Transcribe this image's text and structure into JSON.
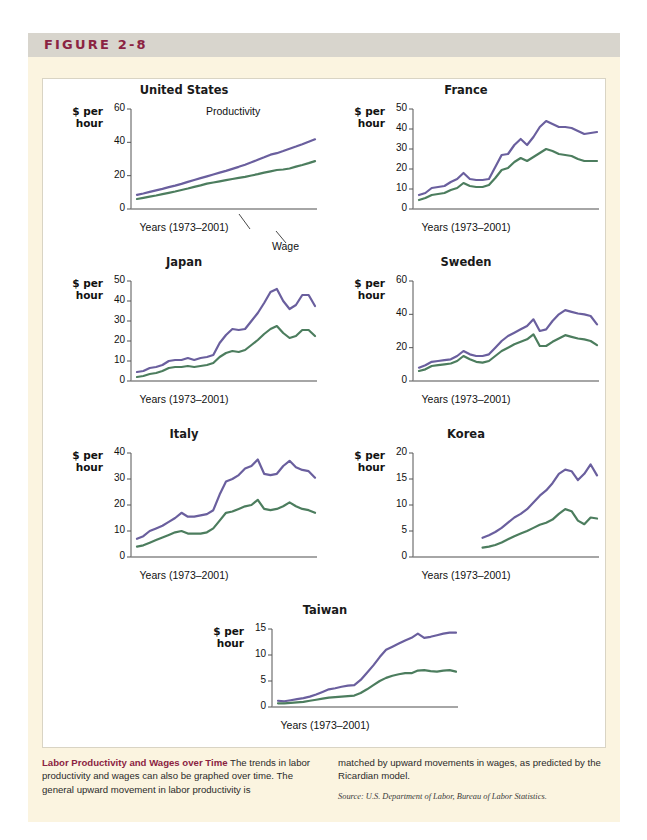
{
  "figure": {
    "label": "FIGURE 2-8",
    "accent_color": "#8b2342",
    "band_color": "#d8d5cd",
    "box_color": "#fbf4e0"
  },
  "series_colors": {
    "productivity": "#6a5f9e",
    "wage": "#4c7d5e"
  },
  "axis_titles": {
    "y_line1": "$ per",
    "y_line2": "hour",
    "x": "Years (1973–2001)"
  },
  "annotations": {
    "productivity": "Productivity",
    "wage": "Wage"
  },
  "caption": {
    "title": "Labor Productivity and Wages over Time",
    "left_text": " The trends in labor productivity and wages can also be graphed over time. The general upward movement in labor productivity is",
    "right_text": "matched by upward movements in wages, as predicted by the Ricardian model.",
    "source": "Source: U.S. Department of Labor, Bureau of Labor Statistics."
  },
  "chart_data": [
    {
      "type": "line",
      "title": "United States",
      "xlabel": "Years (1973–2001)",
      "ylabel": "$ per hour",
      "ylim": [
        0,
        60
      ],
      "yticks": [
        0,
        20,
        40,
        60
      ],
      "grid": false,
      "legend": "inline-annotations",
      "x": [
        1973,
        1974,
        1975,
        1976,
        1977,
        1978,
        1979,
        1980,
        1981,
        1982,
        1983,
        1984,
        1985,
        1986,
        1987,
        1988,
        1989,
        1990,
        1991,
        1992,
        1993,
        1994,
        1995,
        1996,
        1997,
        1998,
        1999,
        2000,
        2001
      ],
      "series": [
        {
          "name": "Productivity",
          "values": [
            8.5,
            9.3,
            10.3,
            11.2,
            12.1,
            13.1,
            14.0,
            15.1,
            16.3,
            17.4,
            18.5,
            19.6,
            20.7,
            21.8,
            22.9,
            24.1,
            25.3,
            26.6,
            28.0,
            29.5,
            31.0,
            32.6,
            33.5,
            34.8,
            36.2,
            37.5,
            38.9,
            40.4,
            41.8
          ]
        },
        {
          "name": "Wage",
          "values": [
            6.0,
            6.7,
            7.4,
            8.1,
            8.9,
            9.7,
            10.5,
            11.4,
            12.3,
            13.3,
            14.2,
            15.2,
            15.9,
            16.6,
            17.3,
            18.0,
            18.7,
            19.3,
            20.1,
            20.9,
            21.8,
            22.6,
            23.4,
            23.7,
            24.3,
            25.4,
            26.4,
            27.5,
            28.7
          ]
        }
      ]
    },
    {
      "type": "line",
      "title": "France",
      "xlabel": "Years (1973–2001)",
      "ylabel": "$ per hour",
      "ylim": [
        0,
        50
      ],
      "yticks": [
        0,
        10,
        20,
        30,
        40,
        50
      ],
      "grid": false,
      "x": [
        1973,
        1974,
        1975,
        1976,
        1977,
        1978,
        1979,
        1980,
        1981,
        1982,
        1983,
        1984,
        1985,
        1986,
        1987,
        1988,
        1989,
        1990,
        1991,
        1992,
        1993,
        1994,
        1995,
        1996,
        1997,
        1998,
        1999,
        2000,
        2001
      ],
      "series": [
        {
          "name": "Productivity",
          "values": [
            7.0,
            8.0,
            10.5,
            11.0,
            11.5,
            13.5,
            15.0,
            18.0,
            15.0,
            14.5,
            14.5,
            15.0,
            21.0,
            27.0,
            27.5,
            32.0,
            35.0,
            32.0,
            36.0,
            41.0,
            44.0,
            42.5,
            41.0,
            41.0,
            40.5,
            39.0,
            37.5,
            38.0,
            38.5
          ]
        },
        {
          "name": "Wage",
          "values": [
            4.5,
            5.5,
            7.0,
            7.5,
            8.0,
            9.5,
            10.5,
            13.0,
            11.5,
            11.0,
            11.0,
            12.0,
            15.5,
            19.5,
            20.5,
            23.5,
            25.5,
            24.0,
            26.0,
            28.0,
            30.0,
            29.0,
            27.5,
            27.0,
            26.5,
            25.0,
            24.0,
            24.0,
            24.0
          ]
        }
      ]
    },
    {
      "type": "line",
      "title": "Japan",
      "xlabel": "Years (1973–2001)",
      "ylabel": "$ per hour",
      "ylim": [
        0,
        50
      ],
      "yticks": [
        0,
        10,
        20,
        30,
        40,
        50
      ],
      "grid": false,
      "x": [
        1973,
        1974,
        1975,
        1976,
        1977,
        1978,
        1979,
        1980,
        1981,
        1982,
        1983,
        1984,
        1985,
        1986,
        1987,
        1988,
        1989,
        1990,
        1991,
        1992,
        1993,
        1994,
        1995,
        1996,
        1997,
        1998,
        1999,
        2000,
        2001
      ],
      "series": [
        {
          "name": "Productivity",
          "values": [
            4.5,
            5.0,
            6.5,
            7.0,
            8.0,
            10.0,
            10.5,
            10.5,
            11.5,
            10.5,
            11.5,
            12.0,
            13.0,
            19.0,
            23.0,
            26.0,
            25.5,
            26.0,
            30.0,
            34.0,
            39.0,
            44.5,
            46.0,
            40.0,
            36.0,
            38.0,
            43.0,
            43.0,
            37.5
          ]
        },
        {
          "name": "Wage",
          "values": [
            2.0,
            2.5,
            3.5,
            4.0,
            5.0,
            6.5,
            7.0,
            7.0,
            7.5,
            7.0,
            7.5,
            8.0,
            9.0,
            12.0,
            14.0,
            15.0,
            14.5,
            15.5,
            18.0,
            20.5,
            23.5,
            26.0,
            27.5,
            24.0,
            21.5,
            22.5,
            25.5,
            25.5,
            22.5
          ]
        }
      ]
    },
    {
      "type": "line",
      "title": "Sweden",
      "xlabel": "Years (1973–2001)",
      "ylabel": "$ per hour",
      "ylim": [
        0,
        60
      ],
      "yticks": [
        0,
        20,
        40,
        60
      ],
      "grid": false,
      "x": [
        1973,
        1974,
        1975,
        1976,
        1977,
        1978,
        1979,
        1980,
        1981,
        1982,
        1983,
        1984,
        1985,
        1986,
        1987,
        1988,
        1989,
        1990,
        1991,
        1992,
        1993,
        1994,
        1995,
        1996,
        1997,
        1998,
        1999,
        2000,
        2001
      ],
      "series": [
        {
          "name": "Productivity",
          "values": [
            8.0,
            9.5,
            11.5,
            12.0,
            12.5,
            13.0,
            15.0,
            18.0,
            16.0,
            15.0,
            15.0,
            16.0,
            20.0,
            24.0,
            27.0,
            29.0,
            31.0,
            33.0,
            37.0,
            30.0,
            31.0,
            36.0,
            40.0,
            42.5,
            41.5,
            40.5,
            40.0,
            39.0,
            34.0
          ]
        },
        {
          "name": "Wage",
          "values": [
            6.0,
            7.0,
            9.0,
            9.5,
            10.0,
            10.5,
            12.0,
            15.0,
            13.0,
            11.5,
            11.0,
            12.0,
            15.0,
            18.0,
            20.0,
            22.0,
            23.5,
            25.0,
            28.0,
            21.0,
            21.0,
            23.5,
            25.5,
            27.5,
            26.5,
            25.5,
            25.0,
            24.0,
            21.5
          ]
        }
      ]
    },
    {
      "type": "line",
      "title": "Italy",
      "xlabel": "Years (1973–2001)",
      "ylabel": "$ per hour",
      "ylim": [
        0,
        40
      ],
      "yticks": [
        0,
        10,
        20,
        30,
        40
      ],
      "grid": false,
      "x": [
        1973,
        1974,
        1975,
        1976,
        1977,
        1978,
        1979,
        1980,
        1981,
        1982,
        1983,
        1984,
        1985,
        1986,
        1987,
        1988,
        1989,
        1990,
        1991,
        1992,
        1993,
        1994,
        1995,
        1996,
        1997,
        1998,
        1999,
        2000,
        2001
      ],
      "series": [
        {
          "name": "Productivity",
          "values": [
            7.0,
            8.0,
            10.0,
            11.0,
            12.0,
            13.5,
            15.0,
            17.0,
            15.5,
            15.5,
            16.0,
            16.5,
            18.0,
            24.0,
            29.0,
            30.0,
            31.5,
            34.0,
            35.0,
            37.5,
            32.0,
            31.5,
            32.0,
            35.0,
            37.0,
            34.5,
            33.5,
            33.0,
            30.5
          ]
        },
        {
          "name": "Wage",
          "values": [
            4.0,
            4.5,
            5.5,
            6.5,
            7.5,
            8.5,
            9.5,
            10.0,
            9.0,
            9.0,
            9.0,
            9.5,
            11.0,
            14.0,
            17.0,
            17.5,
            18.5,
            19.5,
            20.0,
            22.0,
            18.5,
            18.0,
            18.5,
            19.5,
            21.0,
            19.5,
            18.5,
            18.0,
            17.0
          ]
        }
      ]
    },
    {
      "type": "line",
      "title": "Korea",
      "xlabel": "Years (1973–2001)",
      "ylabel": "$ per hour",
      "ylim": [
        0,
        20
      ],
      "yticks": [
        0,
        5,
        10,
        15,
        20
      ],
      "grid": false,
      "x": [
        1983,
        1984,
        1985,
        1986,
        1987,
        1988,
        1989,
        1990,
        1991,
        1992,
        1993,
        1994,
        1995,
        1996,
        1997,
        1998,
        1999,
        2000,
        2001
      ],
      "series": [
        {
          "name": "Productivity",
          "values": [
            3.7,
            4.2,
            4.8,
            5.6,
            6.6,
            7.6,
            8.3,
            9.2,
            10.5,
            11.8,
            12.8,
            14.2,
            16.0,
            16.8,
            16.5,
            14.8,
            16.0,
            17.8,
            15.7
          ]
        },
        {
          "name": "Wage",
          "values": [
            1.8,
            2.0,
            2.3,
            2.8,
            3.4,
            4.0,
            4.5,
            5.0,
            5.6,
            6.2,
            6.6,
            7.2,
            8.3,
            9.2,
            8.8,
            7.0,
            6.3,
            7.6,
            7.4
          ]
        }
      ]
    },
    {
      "type": "line",
      "title": "Taiwan",
      "xlabel": "Years (1973–2001)",
      "ylabel": "$ per hour",
      "ylim": [
        0,
        15
      ],
      "yticks": [
        0,
        5,
        10,
        15
      ],
      "grid": false,
      "x": [
        1973,
        1974,
        1975,
        1976,
        1977,
        1978,
        1979,
        1980,
        1981,
        1982,
        1983,
        1984,
        1985,
        1986,
        1987,
        1988,
        1989,
        1990,
        1991,
        1992,
        1993,
        1994,
        1995,
        1996,
        1997,
        1998,
        1999,
        2000,
        2001
      ],
      "series": [
        {
          "name": "Productivity",
          "values": [
            1.2,
            1.1,
            1.3,
            1.5,
            1.7,
            2.0,
            2.4,
            2.9,
            3.4,
            3.6,
            3.9,
            4.1,
            4.2,
            5.2,
            6.6,
            8.0,
            9.6,
            11.0,
            11.6,
            12.2,
            12.8,
            13.3,
            14.1,
            13.3,
            13.5,
            13.8,
            14.1,
            14.3,
            14.3
          ]
        },
        {
          "name": "Wage",
          "values": [
            0.7,
            0.7,
            0.8,
            0.9,
            1.0,
            1.2,
            1.4,
            1.6,
            1.8,
            1.9,
            2.0,
            2.1,
            2.2,
            2.7,
            3.4,
            4.2,
            5.0,
            5.6,
            6.0,
            6.3,
            6.5,
            6.5,
            7.0,
            7.1,
            6.9,
            6.8,
            7.0,
            7.1,
            6.8
          ]
        }
      ]
    }
  ]
}
